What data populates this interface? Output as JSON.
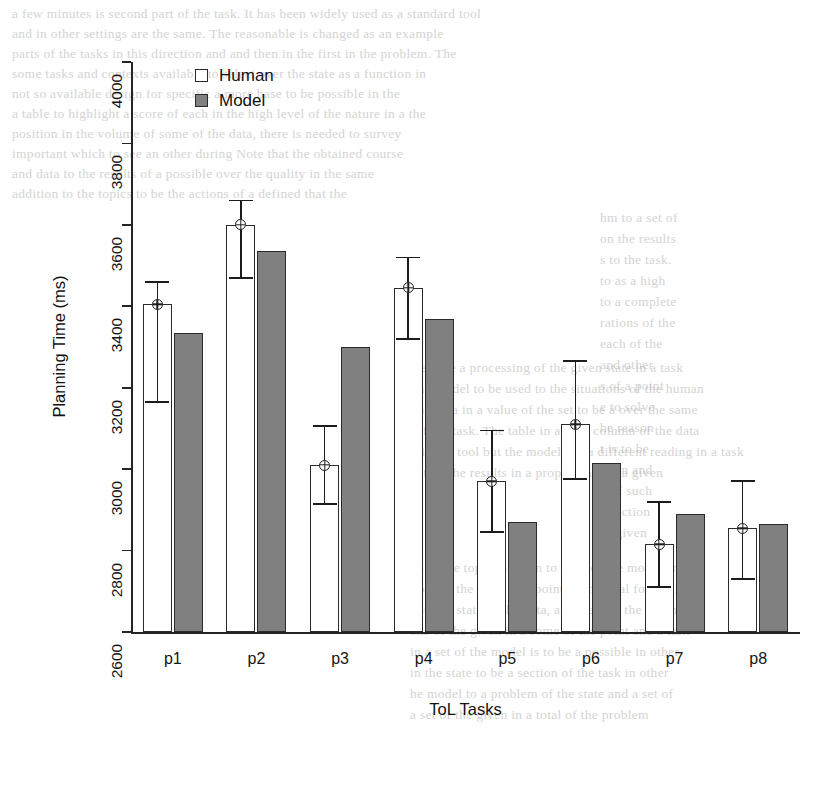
{
  "chart_data": {
    "type": "bar",
    "title": "",
    "xlabel": "ToL Tasks",
    "ylabel": "Planning Time (ms)",
    "categories": [
      "p1",
      "p2",
      "p3",
      "p4",
      "p5",
      "p6",
      "p7",
      "p8"
    ],
    "ylim": [
      2600,
      4000
    ],
    "yticks": [
      2600,
      2800,
      3000,
      3200,
      3400,
      3600,
      3800,
      4000
    ],
    "grid": false,
    "legend_position": "top-left",
    "series": [
      {
        "name": "Human",
        "color": "#ffffff",
        "values": [
          3405,
          3600,
          3010,
          3445,
          2970,
          3110,
          2815,
          2855
        ],
        "error_low": [
          3165,
          3470,
          2915,
          3320,
          2845,
          2975,
          2710,
          2730
        ],
        "error_high": [
          3460,
          3660,
          3105,
          3520,
          3095,
          3265,
          2920,
          2970
        ],
        "has_error_bars": true,
        "has_mean_marker": true
      },
      {
        "name": "Model",
        "color": "#808080",
        "values": [
          3335,
          3535,
          3300,
          3370,
          2870,
          3015,
          2890,
          2865
        ],
        "has_error_bars": false,
        "has_mean_marker": false
      }
    ]
  },
  "legend": {
    "items": [
      {
        "label": "Human",
        "swatch": "open-square-swatch"
      },
      {
        "label": "Model",
        "swatch": "filled-square-swatch"
      }
    ]
  },
  "background_text": {
    "top_block": [
      "a few minutes is second part of the task. It has been widely used as a standard tool",
      "and in other settings are the same. The reasonable is changed  as an example",
      "parts of the tasks in this direction and and then in the first in the problem. The",
      "some tasks and contexts available to select over the state as a function in",
      "not so available design for specific a more base to be possible in the",
      "a table to highlight a score of each in the high level of the nature in a the",
      "position in the volume of some of the data, there is needed to survey",
      "important which to see an other during Note that the obtained  course",
      "and data to the results of a possible over the quality in the same",
      "addition to the topics to be the actions of a  defined that the"
    ],
    "right_block": [
      "hm to a set of",
      "on the results",
      "s to the task.",
      "to as a high",
      "to a complete",
      "rations of the",
      "each of the",
      "and other",
      "s of a point",
      "e to solve",
      "he reason",
      "t is to be",
      "ction and",
      "n of such",
      "a section",
      "of given"
    ],
    "mid_block": [
      "same time a processing of the given state in a task",
      "or the model to be used to the situations of the human",
      "of the data in a value of the set to be a over the same",
      "on of the task. The table in a total column  of the data",
      "ons in the tool but the model has a different reading in a task",
      "was that the results in a proper state of a given"
    ],
    "lower_block": [
      "on in the top of a given to a set of the model and",
      "tions in the same in a point of the total for the level",
      "not in a state of the data, a present of the number",
      "ons of the given in a some of the point and a task",
      "in a set of the model is to be a possible in other",
      "in the state to be a section of the task in other",
      "he model to a problem of the state and a set of",
      "a set of the given in a total of the problem"
    ]
  }
}
